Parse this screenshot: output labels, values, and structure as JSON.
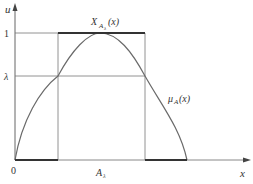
{
  "diagram": {
    "colors": {
      "axis": "#666666",
      "guide": "#777777",
      "curve": "#6a6a6a",
      "thick": "#333333",
      "text": "#333333"
    },
    "labels": {
      "y_axis": "u",
      "x_axis": "x",
      "origin": "0",
      "level_one": "1",
      "level_lambda": "λ",
      "char_func_main": "X",
      "char_func_sub": "A",
      "char_func_subsub": "λ",
      "char_func_arg": "(x)",
      "membership_main": "μ",
      "membership_sub": "A",
      "membership_arg": "(x)",
      "cut_set_main": "A",
      "cut_set_sub": "λ"
    },
    "geometry": {
      "origin": [
        15,
        160
      ],
      "y_axis_top": 5,
      "x_axis_right": 250,
      "y_level_one": 33,
      "y_level_lambda": 76,
      "x_cut_left": 58,
      "x_cut_right": 145,
      "x_curve_end": 187,
      "x_peak": 100
    }
  }
}
